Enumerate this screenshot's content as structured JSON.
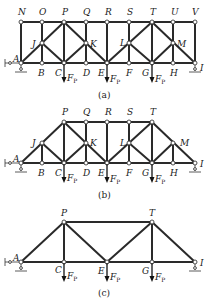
{
  "figure": {
    "panels": [
      {
        "caption": "(a)",
        "top_nodes": [
          "N",
          "O",
          "P",
          "Q",
          "R",
          "S",
          "T",
          "U",
          "V"
        ],
        "mid_nodes": [
          "J",
          "K",
          "L",
          "M"
        ],
        "bottom_nodes": [
          "A",
          "B",
          "C",
          "D",
          "E",
          "F",
          "G",
          "H",
          "I"
        ],
        "loads": [
          {
            "node": "C",
            "label": "F",
            "sub": "P"
          },
          {
            "node": "E",
            "label": "F",
            "sub": "P"
          },
          {
            "node": "G",
            "label": "F",
            "sub": "P"
          }
        ]
      },
      {
        "caption": "(b)",
        "top_nodes": [
          "P",
          "Q",
          "R",
          "S",
          "T"
        ],
        "mid_nodes": [
          "J",
          "K",
          "L",
          "M"
        ],
        "bottom_nodes": [
          "A",
          "B",
          "C",
          "D",
          "E",
          "F",
          "G",
          "H",
          "I"
        ],
        "loads": [
          {
            "node": "C",
            "label": "F",
            "sub": "P"
          },
          {
            "node": "E",
            "label": "F",
            "sub": "P"
          },
          {
            "node": "G",
            "label": "F",
            "sub": "P"
          }
        ]
      },
      {
        "caption": "(c)",
        "top_nodes": [
          "P",
          "T"
        ],
        "mid_nodes": [],
        "bottom_nodes": [
          "A",
          "C",
          "E",
          "G",
          "I"
        ],
        "loads": [
          {
            "node": "C",
            "label": "F",
            "sub": "P"
          },
          {
            "node": "E",
            "label": "F",
            "sub": "P"
          },
          {
            "node": "G",
            "label": "F",
            "sub": "P"
          }
        ]
      }
    ],
    "labels": {
      "A": "A",
      "B": "B",
      "C": "C",
      "D": "D",
      "E": "E",
      "F": "F",
      "G": "G",
      "H": "H",
      "I": "I",
      "J": "J",
      "K": "K",
      "L": "L",
      "M": "M",
      "N": "N",
      "O": "O",
      "P": "P",
      "Q": "Q",
      "R": "R",
      "S": "S",
      "T": "T",
      "U": "U",
      "V": "V",
      "load": "F",
      "load_sub": "P"
    },
    "captions": {
      "a": "(a)",
      "b": "(b)",
      "c": "(c)"
    }
  }
}
